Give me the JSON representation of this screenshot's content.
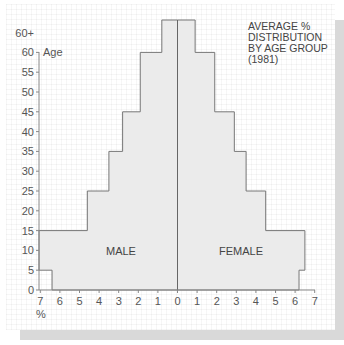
{
  "chart_data": {
    "type": "bar",
    "subtype": "population-pyramid",
    "title_lines": [
      "AVERAGE %",
      "DISTRIBUTION",
      "BY AGE GROUP",
      "(1981)"
    ],
    "xlabel": "%",
    "ylabel": "Age",
    "categories": [
      "0-4",
      "5-14",
      "15-24",
      "25-34",
      "35-44",
      "45-59",
      "60+"
    ],
    "age_bins": [
      [
        0,
        5
      ],
      [
        5,
        15
      ],
      [
        15,
        25
      ],
      [
        25,
        35
      ],
      [
        35,
        45
      ],
      [
        45,
        60
      ],
      [
        60,
        65
      ]
    ],
    "series": [
      {
        "name": "MALE",
        "side": "left",
        "values": [
          6.4,
          7.2,
          4.6,
          3.5,
          2.8,
          1.9,
          0.8
        ]
      },
      {
        "name": "FEMALE",
        "side": "right",
        "values": [
          6.2,
          6.5,
          4.5,
          3.5,
          2.9,
          1.9,
          0.9
        ]
      }
    ],
    "x_ticks_left": [
      "7",
      "6",
      "5",
      "4",
      "3",
      "2",
      "1",
      "0"
    ],
    "x_ticks_right": [
      "1",
      "2",
      "3",
      "4",
      "5",
      "6",
      "7"
    ],
    "y_ticks": [
      "0",
      "5",
      "10",
      "15",
      "20",
      "25",
      "30",
      "35",
      "40",
      "45",
      "50",
      "55",
      "60",
      "60+"
    ],
    "xlim": [
      -7,
      7
    ],
    "ylim": [
      0,
      65
    ],
    "grid": true,
    "legend": "labels inside bars",
    "colors": {
      "bar_fill": "#ebebeb",
      "bar_stroke": "#777777",
      "axis": "#888888",
      "shadow": "#d9d9d9"
    }
  },
  "labels": {
    "male": "MALE",
    "female": "FEMALE",
    "age": "Age",
    "percent": "%"
  }
}
